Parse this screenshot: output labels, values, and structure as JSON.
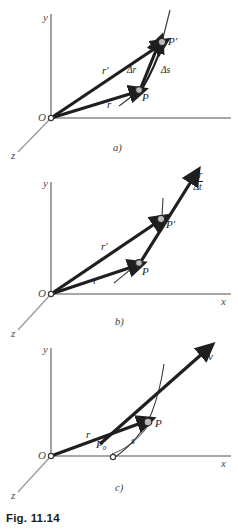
{
  "figure": {
    "caption": "Fig. 11.14",
    "background": "#ffffff",
    "ink_color": "#1f1f1f",
    "axis_color": "#8b8b8b"
  },
  "panels": [
    {
      "key": "a",
      "sublabel": "a)",
      "axes": {
        "y": "y",
        "x": "x",
        "z": "z",
        "origin": "O"
      },
      "points": [
        {
          "name": "P",
          "label": "P"
        },
        {
          "name": "P-prime",
          "label": "P′"
        }
      ],
      "vectors": [
        {
          "name": "r",
          "label": "r"
        },
        {
          "name": "r-prime",
          "label": "r′"
        },
        {
          "name": "delta-r",
          "label": "Δr"
        },
        {
          "name": "delta-s",
          "label": "Δs"
        }
      ]
    },
    {
      "key": "b",
      "sublabel": "b)",
      "axes": {
        "y": "y",
        "x": "x",
        "z": "z",
        "origin": "O"
      },
      "points": [
        {
          "name": "P",
          "label": "P"
        },
        {
          "name": "P-prime",
          "label": "P′"
        }
      ],
      "vectors": [
        {
          "name": "r",
          "label": "r"
        },
        {
          "name": "r-prime",
          "label": "r′"
        }
      ],
      "fraction": {
        "numerator": "Δr",
        "denominator": "Δt"
      }
    },
    {
      "key": "c",
      "sublabel": "c)",
      "axes": {
        "y": "y",
        "x": "x",
        "z": "z",
        "origin": "O"
      },
      "points": [
        {
          "name": "P",
          "label": "P"
        },
        {
          "name": "P-zero",
          "label": "P₀"
        }
      ],
      "vectors": [
        {
          "name": "r",
          "label": "r"
        },
        {
          "name": "v",
          "label": "v"
        }
      ],
      "arc": {
        "name": "arc-length",
        "label": "s"
      }
    }
  ]
}
